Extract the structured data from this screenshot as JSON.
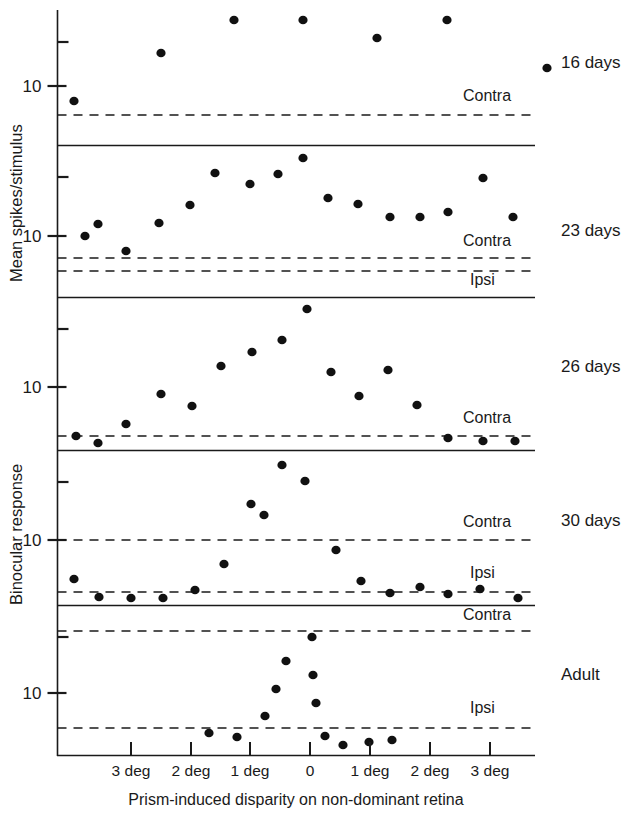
{
  "figure": {
    "axis_titles": {
      "y_top": "Mean spikes/stimulus",
      "y_bottom": "Binocular response",
      "x": "Prism-induced disparity on non-dominant retina"
    },
    "y_tick_label": "10",
    "reference_labels": {
      "contra": "Contra",
      "ipsi": "Ipsi"
    }
  },
  "chart_data": {
    "type": "scatter",
    "title": "",
    "subtitle": "",
    "xlabel": "Prism-induced disparity on non-dominant retina",
    "ylabel": "Mean spikes/stimulus — Binocular response",
    "yscale": "log",
    "grid": false,
    "legend": "none",
    "x_axis": {
      "ticks_px": [
        131,
        191,
        250,
        310,
        370,
        430,
        490
      ],
      "tick_labels": [
        "3 deg",
        "2 deg",
        "1 deg",
        "0",
        "1 deg",
        "2 deg",
        "3 deg"
      ],
      "tick_values": [
        -3,
        -2,
        -1,
        0,
        1,
        2,
        3
      ],
      "range": [
        -3.8,
        3.8
      ],
      "note": "Disparity in degrees either side of zero"
    },
    "panels": [
      {
        "label": "16 days",
        "label_y_px": 68,
        "top_px": 10,
        "bottom_px": 145,
        "ytick_label": "10",
        "ytick_px": 86,
        "minor_tick_px": [
          42
        ],
        "reference_lines": [
          {
            "name": "Contra",
            "y_px": 115,
            "label_x_px": 463,
            "label_y_px": 101
          }
        ],
        "points": [
          {
            "x_px": 74,
            "y_px": 101
          },
          {
            "x_px": 161,
            "y_px": 53
          },
          {
            "x_px": 234,
            "y_px": 20
          },
          {
            "x_px": 303,
            "y_px": 20
          },
          {
            "x_px": 377,
            "y_px": 38
          },
          {
            "x_px": 447,
            "y_px": 20
          },
          {
            "x_px": 547,
            "y_px": 68
          }
        ]
      },
      {
        "label": "23 days",
        "label_y_px": 236,
        "top_px": 145,
        "bottom_px": 297,
        "ytick_label": "10",
        "ytick_px": 236,
        "minor_tick_px": [
          177
        ],
        "reference_lines": [
          {
            "name": "Contra",
            "y_px": 258,
            "label_x_px": 463,
            "label_y_px": 246
          },
          {
            "name": "Ipsi",
            "y_px": 271,
            "label_x_px": 470,
            "label_y_px": 285
          }
        ],
        "points": [
          {
            "x_px": 85,
            "y_px": 236
          },
          {
            "x_px": 98,
            "y_px": 224
          },
          {
            "x_px": 126,
            "y_px": 251
          },
          {
            "x_px": 159,
            "y_px": 223
          },
          {
            "x_px": 190,
            "y_px": 205
          },
          {
            "x_px": 215,
            "y_px": 173
          },
          {
            "x_px": 250,
            "y_px": 184
          },
          {
            "x_px": 278,
            "y_px": 174
          },
          {
            "x_px": 303,
            "y_px": 158
          },
          {
            "x_px": 328,
            "y_px": 198
          },
          {
            "x_px": 358,
            "y_px": 204
          },
          {
            "x_px": 390,
            "y_px": 217
          },
          {
            "x_px": 420,
            "y_px": 217
          },
          {
            "x_px": 448,
            "y_px": 212
          },
          {
            "x_px": 483,
            "y_px": 178
          },
          {
            "x_px": 513,
            "y_px": 217
          }
        ]
      },
      {
        "label": "26 days",
        "label_y_px": 372,
        "top_px": 297,
        "bottom_px": 450,
        "ytick_label": "10",
        "ytick_px": 387,
        "minor_tick_px": [
          329
        ],
        "reference_lines": [
          {
            "name": "Contra",
            "y_px": 436,
            "label_x_px": 463,
            "label_y_px": 423
          }
        ],
        "points": [
          {
            "x_px": 76,
            "y_px": 436
          },
          {
            "x_px": 98,
            "y_px": 443
          },
          {
            "x_px": 126,
            "y_px": 424
          },
          {
            "x_px": 161,
            "y_px": 394
          },
          {
            "x_px": 192,
            "y_px": 406
          },
          {
            "x_px": 221,
            "y_px": 366
          },
          {
            "x_px": 252,
            "y_px": 352
          },
          {
            "x_px": 282,
            "y_px": 340
          },
          {
            "x_px": 307,
            "y_px": 309
          },
          {
            "x_px": 331,
            "y_px": 372
          },
          {
            "x_px": 359,
            "y_px": 396
          },
          {
            "x_px": 388,
            "y_px": 370
          },
          {
            "x_px": 417,
            "y_px": 405
          },
          {
            "x_px": 448,
            "y_px": 438
          },
          {
            "x_px": 483,
            "y_px": 441
          },
          {
            "x_px": 515,
            "y_px": 441
          }
        ]
      },
      {
        "label": "30 days",
        "label_y_px": 526,
        "top_px": 450,
        "bottom_px": 605,
        "ytick_label": "10",
        "ytick_px": 540,
        "minor_tick_px": [
          482
        ],
        "reference_lines": [
          {
            "name": "Contra",
            "y_px": 540,
            "label_x_px": 463,
            "label_y_px": 527
          },
          {
            "name": "Ipsi",
            "y_px": 592,
            "label_x_px": 470,
            "label_y_px": 578
          }
        ],
        "points": [
          {
            "x_px": 74,
            "y_px": 579
          },
          {
            "x_px": 99,
            "y_px": 597
          },
          {
            "x_px": 131,
            "y_px": 598
          },
          {
            "x_px": 163,
            "y_px": 598
          },
          {
            "x_px": 195,
            "y_px": 590
          },
          {
            "x_px": 224,
            "y_px": 564
          },
          {
            "x_px": 251,
            "y_px": 504
          },
          {
            "x_px": 264,
            "y_px": 515
          },
          {
            "x_px": 282,
            "y_px": 465
          },
          {
            "x_px": 305,
            "y_px": 481
          },
          {
            "x_px": 336,
            "y_px": 550
          },
          {
            "x_px": 361,
            "y_px": 581
          },
          {
            "x_px": 390,
            "y_px": 593
          },
          {
            "x_px": 420,
            "y_px": 587
          },
          {
            "x_px": 448,
            "y_px": 594
          },
          {
            "x_px": 480,
            "y_px": 589
          },
          {
            "x_px": 518,
            "y_px": 598
          }
        ]
      },
      {
        "label": "Adult",
        "label_y_px": 680,
        "top_px": 605,
        "bottom_px": 755,
        "ytick_label": "10",
        "ytick_px": 693,
        "minor_tick_px": [
          637
        ],
        "reference_lines": [
          {
            "name": "Contra",
            "y_px": 631,
            "label_x_px": 463,
            "label_y_px": 620
          },
          {
            "name": "Ipsi",
            "y_px": 728,
            "label_x_px": 470,
            "label_y_px": 713
          }
        ],
        "points": [
          {
            "x_px": 209,
            "y_px": 733
          },
          {
            "x_px": 237,
            "y_px": 737
          },
          {
            "x_px": 265,
            "y_px": 716
          },
          {
            "x_px": 276,
            "y_px": 689
          },
          {
            "x_px": 286,
            "y_px": 661
          },
          {
            "x_px": 312,
            "y_px": 637
          },
          {
            "x_px": 313,
            "y_px": 675
          },
          {
            "x_px": 316,
            "y_px": 703
          },
          {
            "x_px": 325,
            "y_px": 736
          },
          {
            "x_px": 343,
            "y_px": 745
          },
          {
            "x_px": 369,
            "y_px": 742
          },
          {
            "x_px": 392,
            "y_px": 740
          }
        ]
      }
    ]
  }
}
